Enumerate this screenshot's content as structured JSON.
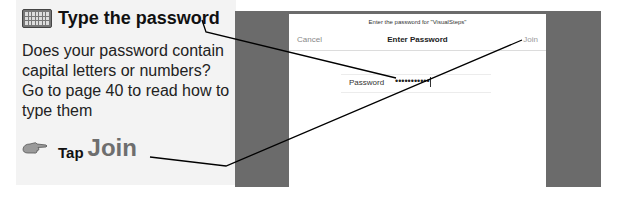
{
  "instructions": {
    "step1": {
      "icon": "keyboard-icon",
      "title": "Type the password"
    },
    "note": "Does your password contain capital letters or numbers? Go to page 40 to read how to type them",
    "step2": {
      "icon": "pointing-hand-icon",
      "verb": "Tap",
      "target": "Join"
    }
  },
  "dialog": {
    "subtitle": "Enter the password for \"VisualSteps\"",
    "title": "Enter Password",
    "cancel_label": "Cancel",
    "join_label": "Join",
    "password_label": "Password",
    "password_value": "•••••••••••"
  },
  "colors": {
    "panel_bg": "#f3f3f3",
    "screen_bg": "#6b6b6b",
    "dialog_bg": "#ffffff"
  }
}
